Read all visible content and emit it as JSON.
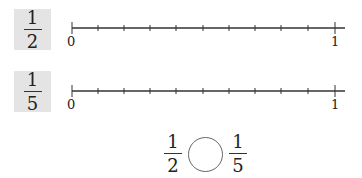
{
  "rows": [
    {
      "fraction": {
        "numerator": "1",
        "denominator": "2"
      },
      "number_line": {
        "start_label": "0",
        "end_label": "1",
        "divisions": 10
      }
    },
    {
      "fraction": {
        "numerator": "1",
        "denominator": "5"
      },
      "number_line": {
        "start_label": "0",
        "end_label": "1",
        "divisions": 10
      }
    }
  ],
  "comparison": {
    "left": {
      "numerator": "1",
      "denominator": "2"
    },
    "right": {
      "numerator": "1",
      "denominator": "5"
    },
    "answer_blank": ""
  },
  "colors": {
    "label_bg": "#e4e4e4",
    "line": "#333333"
  }
}
